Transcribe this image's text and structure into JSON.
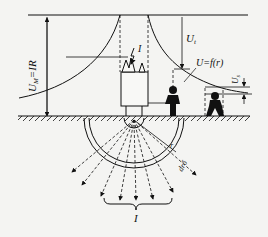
{
  "diagram": {
    "type": "ground-fault potential distribution",
    "labels": {
      "ground_voltage": "U",
      "ground_voltage_sub": "M",
      "ground_voltage_eq": "=IR",
      "current_top": "I",
      "touch_voltage": "U",
      "touch_voltage_sub": "t",
      "potential_function": "U=f(r)",
      "step_voltage": "U",
      "step_voltage_sub": "s",
      "radius": "r",
      "shell": "dr",
      "delta": "δ",
      "current_bottom": "I"
    },
    "colors": {
      "line": "#111111",
      "background": "#f4f4f2"
    }
  }
}
